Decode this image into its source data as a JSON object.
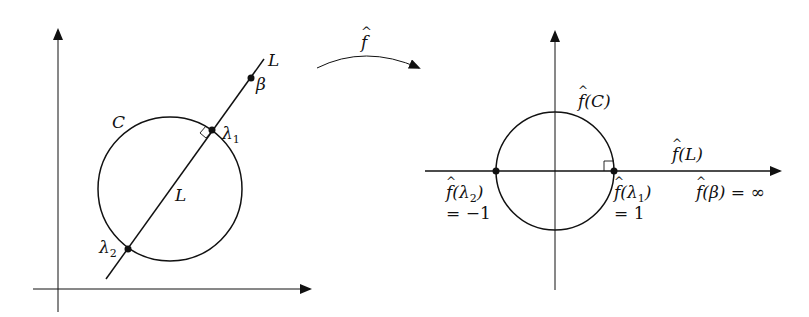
{
  "diagram": {
    "left_panel": {
      "circle_label": "C",
      "line_label_top": "L",
      "line_label_inside": "L",
      "points": [
        {
          "name": "lambda1",
          "label": "λ",
          "subscript": "1"
        },
        {
          "name": "lambda2",
          "label": "λ",
          "subscript": "2"
        },
        {
          "name": "beta",
          "label": "β"
        }
      ]
    },
    "map": {
      "label": "f",
      "hat": "^"
    },
    "right_panel": {
      "circle_label": "f(C)",
      "line_label": "f(L)",
      "infinity_label": "f(β) = ∞",
      "point_left_label": "f(λ",
      "point_left_sub": "2",
      "point_left_close": ")",
      "point_left_value": "= −1",
      "point_right_label": "f(λ",
      "point_right_sub": "1",
      "point_right_close": ")",
      "point_right_value": "= 1"
    }
  }
}
